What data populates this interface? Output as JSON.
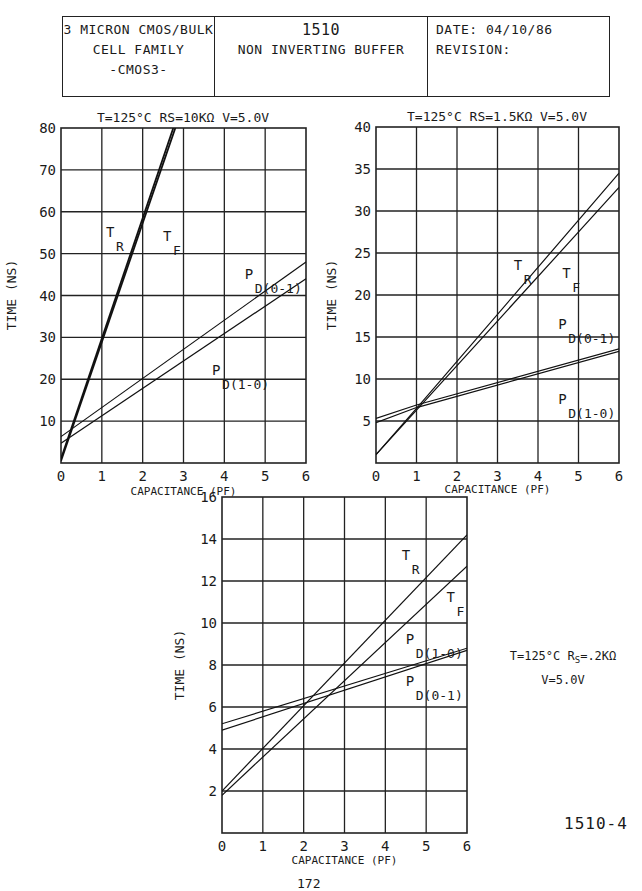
{
  "header": {
    "left": [
      "3 MICRON CMOS/BULK",
      "CELL FAMILY",
      "-CMOS3-"
    ],
    "center": {
      "number": "1510",
      "title": "NON INVERTING BUFFER"
    },
    "right": {
      "date": "DATE: 04/10/86",
      "revision": "REVISION:"
    }
  },
  "page_id": "1510-4",
  "page_number": "172",
  "chart_data": [
    {
      "type": "line",
      "title": "T=125°C RS=10KΩ V=5.0V",
      "xlabel": "CAPACITANCE (PF)",
      "ylabel": "TIME (NS)",
      "xlim": [
        0,
        6
      ],
      "ylim": [
        0,
        80
      ],
      "xticks": [
        "0",
        "1",
        "2",
        "3",
        "4",
        "5",
        "6"
      ],
      "yticks": [
        "10",
        "20",
        "30",
        "40",
        "50",
        "60",
        "70",
        "80"
      ],
      "grid": true,
      "series": [
        {
          "name": "TR",
          "x": [
            0,
            2.75
          ],
          "y": [
            1,
            80
          ]
        },
        {
          "name": "TF",
          "x": [
            0,
            2.8
          ],
          "y": [
            0.5,
            80
          ]
        },
        {
          "name": "PD(0-1)",
          "x": [
            0,
            6
          ],
          "y": [
            6.3,
            48
          ]
        },
        {
          "name": "PD(1-0)",
          "x": [
            0,
            6
          ],
          "y": [
            4.7,
            44
          ]
        }
      ],
      "annotations": [
        {
          "text": "TR",
          "x": 1.1,
          "y": 54
        },
        {
          "text": "TF",
          "x": 2.5,
          "y": 53
        },
        {
          "text": "PD(0-1)",
          "x": 4.5,
          "y": 44
        },
        {
          "text": "PD(1-0)",
          "x": 3.7,
          "y": 21
        }
      ]
    },
    {
      "type": "line",
      "title": "T=125°C RS=1.5KΩ V=5.0V",
      "xlabel": "CAPACITANCE (PF)",
      "ylabel": "TIME (NS)",
      "xlim": [
        0,
        6
      ],
      "ylim": [
        0,
        40
      ],
      "xticks": [
        "0",
        "1",
        "2",
        "3",
        "4",
        "5",
        "6"
      ],
      "yticks": [
        "5",
        "10",
        "15",
        "20",
        "25",
        "30",
        "35",
        "40"
      ],
      "grid": true,
      "series": [
        {
          "name": "TR",
          "x": [
            0,
            1,
            6
          ],
          "y": [
            1,
            6.5,
            34.5
          ]
        },
        {
          "name": "TF",
          "x": [
            0,
            1,
            6
          ],
          "y": [
            1,
            6.3,
            32.8
          ]
        },
        {
          "name": "PD(0-1)",
          "x": [
            0,
            1,
            6
          ],
          "y": [
            5.3,
            6.9,
            13.6
          ]
        },
        {
          "name": "PD(1-0)",
          "x": [
            0,
            1,
            6
          ],
          "y": [
            4.8,
            6.6,
            13.3
          ]
        }
      ],
      "annotations": [
        {
          "text": "TR",
          "x": 3.4,
          "y": 23
        },
        {
          "text": "TF",
          "x": 4.6,
          "y": 22
        },
        {
          "text": "PD(0-1)",
          "x": 4.5,
          "y": 16
        },
        {
          "text": "PD(1-0)",
          "x": 4.5,
          "y": 7
        }
      ]
    },
    {
      "type": "line",
      "title": "T=125°C RS=.2KΩ V=5.0V",
      "xlabel": "CAPACITANCE (PF)",
      "ylabel": "TIME (NS)",
      "xlim": [
        0,
        6
      ],
      "ylim": [
        0,
        16
      ],
      "xticks": [
        "0",
        "1",
        "2",
        "3",
        "4",
        "5",
        "6"
      ],
      "yticks": [
        "2",
        "4",
        "6",
        "8",
        "10",
        "12",
        "14",
        "16"
      ],
      "grid": true,
      "series": [
        {
          "name": "TR",
          "x": [
            0,
            6
          ],
          "y": [
            2.0,
            14.2
          ]
        },
        {
          "name": "TF",
          "x": [
            0,
            6
          ],
          "y": [
            1.8,
            12.7
          ]
        },
        {
          "name": "PD(1-0)",
          "x": [
            0,
            6
          ],
          "y": [
            5.2,
            8.8
          ]
        },
        {
          "name": "PD(0-1)",
          "x": [
            0,
            6
          ],
          "y": [
            4.9,
            8.7
          ]
        }
      ],
      "annotations": [
        {
          "text": "TR",
          "x": 4.4,
          "y": 13
        },
        {
          "text": "TF",
          "x": 5.5,
          "y": 11
        },
        {
          "text": "PD(1-0)",
          "x": 4.5,
          "y": 9
        },
        {
          "text": "PD(0-1)",
          "x": 4.5,
          "y": 7
        }
      ]
    }
  ]
}
